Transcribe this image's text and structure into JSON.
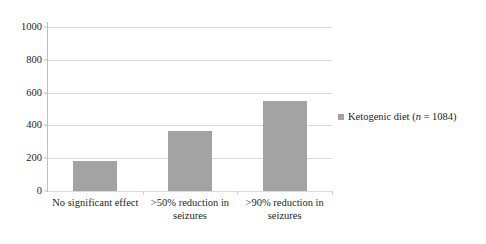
{
  "chart_data": {
    "type": "bar",
    "title": "",
    "subtitle": "",
    "xlabel": "",
    "ylabel": "",
    "categories": [
      "No significant effect",
      ">50% reduction in seizures",
      ">90% reduction in seizures"
    ],
    "category_lines": [
      [
        "No significant effect"
      ],
      [
        ">50% reduction in",
        "seizures"
      ],
      [
        ">90% reduction in",
        "seizures"
      ]
    ],
    "series": [
      {
        "name": "Ketogenic diet (n = 1084)",
        "values": [
          180,
          366,
          549
        ],
        "color": "#a3a3a3"
      }
    ],
    "values": [
      180,
      366,
      549
    ],
    "ylim": [
      0,
      1000
    ],
    "ytick_values": [
      0,
      200,
      400,
      600,
      800,
      1000
    ],
    "ytick_labels": [
      "0",
      "200",
      "400",
      "600",
      "800",
      "1000"
    ],
    "grid": true,
    "grid_axis": "y",
    "grid_color": "#d9d9d9",
    "legend_position": "right",
    "legend": [
      {
        "label_prefix": "Ketogenic diet (",
        "label_italic": "n",
        "label_suffix": " = 1084)",
        "full_label": "Ketogenic diet (n = 1084)",
        "swatch_color": "#a3a3a3"
      }
    ],
    "axis_line_color": "#bfbfbf",
    "background": "#ffffff"
  }
}
